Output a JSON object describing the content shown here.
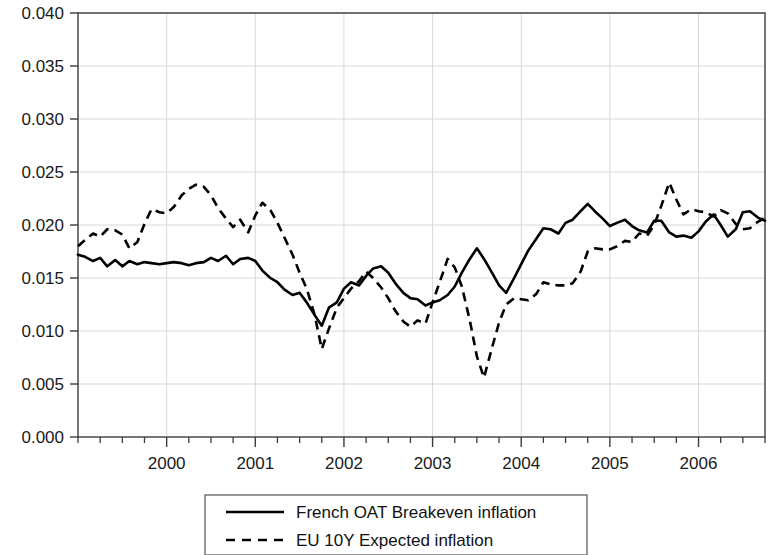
{
  "chart_data": {
    "type": "line",
    "title": "",
    "subtitle": "",
    "xlabel": "",
    "ylabel": "",
    "xlim": [
      1999.0,
      2006.75
    ],
    "ylim": [
      0.0,
      0.04
    ],
    "grid": true,
    "legend_position": "bottom-center",
    "y_ticks": [
      "0.000",
      "0.005",
      "0.010",
      "0.015",
      "0.020",
      "0.025",
      "0.030",
      "0.035",
      "0.040"
    ],
    "y_tick_values": [
      0.0,
      0.005,
      0.01,
      0.015,
      0.02,
      0.025,
      0.03,
      0.035,
      0.04
    ],
    "x_ticks": [
      "2000",
      "2001",
      "2002",
      "2003",
      "2004",
      "2005",
      "2006"
    ],
    "x_tick_values": [
      2000,
      2001,
      2002,
      2003,
      2004,
      2005,
      2006
    ],
    "x_minor_tick_step": 0.25,
    "series": [
      {
        "name": "French OAT Breakeven inflation",
        "style": "solid",
        "color": "#000000",
        "x": [
          1999.0,
          1999.08,
          1999.17,
          1999.25,
          1999.33,
          1999.42,
          1999.5,
          1999.58,
          1999.67,
          1999.75,
          1999.83,
          1999.92,
          2000.0,
          2000.08,
          2000.17,
          2000.25,
          2000.33,
          2000.42,
          2000.5,
          2000.58,
          2000.67,
          2000.75,
          2000.83,
          2000.92,
          2001.0,
          2001.08,
          2001.17,
          2001.25,
          2001.33,
          2001.42,
          2001.5,
          2001.58,
          2001.67,
          2001.75,
          2001.83,
          2001.92,
          2002.0,
          2002.08,
          2002.17,
          2002.25,
          2002.33,
          2002.42,
          2002.5,
          2002.58,
          2002.67,
          2002.75,
          2002.83,
          2002.92,
          2003.0,
          2003.08,
          2003.17,
          2003.25,
          2003.33,
          2003.42,
          2003.5,
          2003.58,
          2003.67,
          2003.75,
          2003.83,
          2003.92,
          2004.0,
          2004.08,
          2004.17,
          2004.25,
          2004.33,
          2004.42,
          2004.5,
          2004.58,
          2004.67,
          2004.75,
          2004.83,
          2004.92,
          2005.0,
          2005.08,
          2005.17,
          2005.25,
          2005.33,
          2005.42,
          2005.5,
          2005.58,
          2005.67,
          2005.75,
          2005.83,
          2005.92,
          2006.0,
          2006.08,
          2006.17,
          2006.25,
          2006.33,
          2006.42,
          2006.5,
          2006.58,
          2006.67,
          2006.75
        ],
        "y": [
          0.0172,
          0.017,
          0.0166,
          0.0169,
          0.0161,
          0.0167,
          0.0161,
          0.0166,
          0.0163,
          0.0165,
          0.0164,
          0.0163,
          0.0164,
          0.0165,
          0.0164,
          0.0162,
          0.0164,
          0.0165,
          0.0169,
          0.0166,
          0.0171,
          0.0163,
          0.0168,
          0.0169,
          0.0166,
          0.0157,
          0.015,
          0.0146,
          0.0139,
          0.0134,
          0.0136,
          0.0127,
          0.0115,
          0.0105,
          0.0122,
          0.0127,
          0.014,
          0.0146,
          0.0143,
          0.0152,
          0.0159,
          0.0161,
          0.0155,
          0.0145,
          0.0136,
          0.0131,
          0.013,
          0.0124,
          0.0127,
          0.0129,
          0.0134,
          0.0142,
          0.0155,
          0.0168,
          0.0178,
          0.0168,
          0.0155,
          0.0143,
          0.0136,
          0.015,
          0.0163,
          0.0176,
          0.0187,
          0.0197,
          0.0196,
          0.0192,
          0.0202,
          0.0205,
          0.0213,
          0.022,
          0.0213,
          0.0206,
          0.0199,
          0.0202,
          0.0205,
          0.0199,
          0.0195,
          0.0193,
          0.0204,
          0.0204,
          0.0193,
          0.0189,
          0.019,
          0.0188,
          0.0194,
          0.0203,
          0.021,
          0.02,
          0.0189,
          0.0196,
          0.0212,
          0.0213,
          0.0207,
          0.0204
        ]
      },
      {
        "name": "EU 10Y Expected inflation",
        "style": "dashed",
        "color": "#000000",
        "x": [
          1999.0,
          1999.08,
          1999.17,
          1999.25,
          1999.33,
          1999.42,
          1999.5,
          1999.58,
          1999.67,
          1999.75,
          1999.83,
          1999.92,
          2000.0,
          2000.08,
          2000.17,
          2000.25,
          2000.33,
          2000.42,
          2000.5,
          2000.58,
          2000.67,
          2000.75,
          2000.83,
          2000.92,
          2001.0,
          2001.08,
          2001.17,
          2001.25,
          2001.33,
          2001.42,
          2001.5,
          2001.58,
          2001.67,
          2001.75,
          2001.83,
          2001.92,
          2002.0,
          2002.08,
          2002.17,
          2002.25,
          2002.33,
          2002.42,
          2002.5,
          2002.58,
          2002.67,
          2002.75,
          2002.83,
          2002.92,
          2003.0,
          2003.08,
          2003.17,
          2003.25,
          2003.33,
          2003.42,
          2003.5,
          2003.58,
          2003.67,
          2003.75,
          2003.83,
          2003.92,
          2004.0,
          2004.08,
          2004.17,
          2004.25,
          2004.33,
          2004.42,
          2004.5,
          2004.58,
          2004.67,
          2004.75,
          2004.83,
          2004.92,
          2005.0,
          2005.08,
          2005.17,
          2005.25,
          2005.33,
          2005.42,
          2005.5,
          2005.58,
          2005.67,
          2005.75,
          2005.83,
          2005.92,
          2006.0,
          2006.08,
          2006.17,
          2006.25,
          2006.33,
          2006.42,
          2006.5,
          2006.58,
          2006.67,
          2006.75
        ],
        "y": [
          0.018,
          0.0186,
          0.0192,
          0.0189,
          0.0196,
          0.0195,
          0.0191,
          0.0178,
          0.0184,
          0.0201,
          0.0215,
          0.0212,
          0.0211,
          0.0217,
          0.0228,
          0.0234,
          0.0238,
          0.0236,
          0.0228,
          0.0216,
          0.0206,
          0.0198,
          0.0205,
          0.0193,
          0.0209,
          0.0221,
          0.0214,
          0.0202,
          0.0188,
          0.0172,
          0.0155,
          0.014,
          0.0115,
          0.0083,
          0.0102,
          0.0122,
          0.0131,
          0.014,
          0.0147,
          0.0156,
          0.015,
          0.0141,
          0.0131,
          0.0119,
          0.0109,
          0.0104,
          0.011,
          0.0107,
          0.0127,
          0.0146,
          0.0168,
          0.016,
          0.0142,
          0.011,
          0.0076,
          0.0056,
          0.0084,
          0.0108,
          0.0125,
          0.0131,
          0.013,
          0.0129,
          0.0135,
          0.0146,
          0.0144,
          0.0143,
          0.0143,
          0.0145,
          0.0156,
          0.0175,
          0.0178,
          0.0177,
          0.0177,
          0.018,
          0.0185,
          0.0184,
          0.0192,
          0.019,
          0.02,
          0.0218,
          0.024,
          0.0224,
          0.021,
          0.0215,
          0.0213,
          0.0212,
          0.0208,
          0.0214,
          0.0211,
          0.0201,
          0.0196,
          0.0197,
          0.0203,
          0.0207
        ]
      }
    ]
  },
  "legend": {
    "entries": [
      {
        "label": "French OAT Breakeven inflation",
        "style": "solid"
      },
      {
        "label": "EU 10Y Expected inflation",
        "style": "dashed"
      }
    ]
  }
}
